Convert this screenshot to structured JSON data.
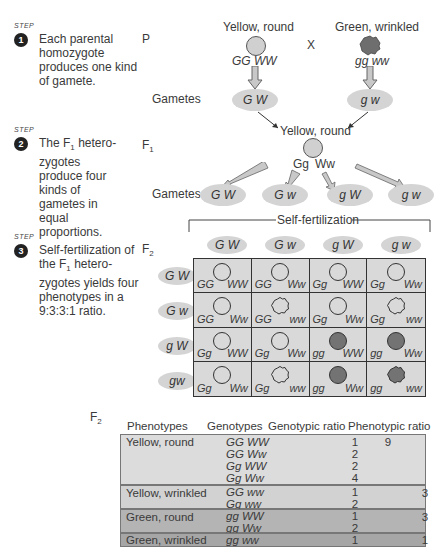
{
  "steps": [
    {
      "tag": "STEP",
      "number": "1",
      "text": "Each parental homozygote produces one kind of gamete."
    },
    {
      "tag": "STEP",
      "number": "2",
      "text": "The F₁ hetero-zygotes produce four kinds of gametes in equal proportions."
    },
    {
      "tag": "STEP",
      "number": "3",
      "text": "Self-fertilization of the F₁ hetero-zygotes yields four phenotypes in a 9:3:3:1 ratio."
    }
  ],
  "generation_labels": {
    "p": "P",
    "f1": "F",
    "f1_sub": "1",
    "f2": "F",
    "f2_sub": "2",
    "gametes": "Gametes",
    "cross": "X"
  },
  "parents": [
    {
      "phenotype": "Yellow, round",
      "genotype": "GG WW",
      "gamete": "G W",
      "color": "#d0d0d0",
      "shape": "round"
    },
    {
      "phenotype": "Green, wrinkled",
      "genotype": "gg ww",
      "gamete": "g w",
      "color": "#6e6e6e",
      "shape": "wrinkled"
    }
  ],
  "f1": {
    "phenotype": "Yellow, round",
    "genotype_g": "Gg",
    "genotype_w": "Ww",
    "gametes": [
      "G W",
      "G w",
      "g W",
      "g w"
    ]
  },
  "self_fertilization_label": "Self-fertilization",
  "punnett": {
    "column_gametes": [
      "G W",
      "G w",
      "g W",
      "g w"
    ],
    "row_gametes": [
      "G W",
      "G w",
      "g W",
      "gw"
    ],
    "cells": [
      [
        {
          "g": "GG",
          "w": "WW",
          "color": "yellow",
          "shape": "round"
        },
        {
          "g": "GG",
          "w": "Ww",
          "color": "yellow",
          "shape": "round"
        },
        {
          "g": "Gg",
          "w": "WW",
          "color": "yellow",
          "shape": "round"
        },
        {
          "g": "Gg",
          "w": "Ww",
          "color": "yellow",
          "shape": "round"
        }
      ],
      [
        {
          "g": "GG",
          "w": "Ww",
          "color": "yellow",
          "shape": "round"
        },
        {
          "g": "GG",
          "w": "ww",
          "color": "yellow",
          "shape": "wrinkled"
        },
        {
          "g": "Gg",
          "w": "Ww",
          "color": "yellow",
          "shape": "round"
        },
        {
          "g": "Gg",
          "w": "ww",
          "color": "yellow",
          "shape": "wrinkled"
        }
      ],
      [
        {
          "g": "Gg",
          "w": "WW",
          "color": "yellow",
          "shape": "round"
        },
        {
          "g": "Gg",
          "w": "Ww",
          "color": "yellow",
          "shape": "round"
        },
        {
          "g": "gg",
          "w": "WW",
          "color": "green",
          "shape": "round"
        },
        {
          "g": "gg",
          "w": "Ww",
          "color": "green",
          "shape": "round"
        }
      ],
      [
        {
          "g": "Gg",
          "w": "Ww",
          "color": "yellow",
          "shape": "round"
        },
        {
          "g": "Gg",
          "w": "ww",
          "color": "yellow",
          "shape": "wrinkled"
        },
        {
          "g": "gg",
          "w": "Ww",
          "color": "green",
          "shape": "round"
        },
        {
          "g": "gg",
          "w": "ww",
          "color": "green",
          "shape": "wrinkled"
        }
      ]
    ]
  },
  "f2_table": {
    "label": "F",
    "label_sub": "2",
    "headers": [
      "Phenotypes",
      "Genotypes",
      "Genotypic ratio",
      "Phenotypic ratio"
    ],
    "rows": [
      {
        "phenotype": "Yellow, round",
        "genotypes": [
          "GG  WW",
          "GG  Ww",
          "Gg  WW",
          "Gg  Ww"
        ],
        "genotypic_ratios": [
          "1",
          "2",
          "2",
          "4"
        ],
        "phenotypic_ratio": "9",
        "bg": "#dcdcdc"
      },
      {
        "phenotype": "Yellow, wrinkled",
        "genotypes": [
          "GG  ww",
          "Gg  ww"
        ],
        "genotypic_ratios": [
          "1",
          "2"
        ],
        "phenotypic_ratio": "3",
        "bg": "#d2d2d2"
      },
      {
        "phenotype": "Green, round",
        "genotypes": [
          "gg  WW",
          "gg  Ww"
        ],
        "genotypic_ratios": [
          "1",
          "2"
        ],
        "phenotypic_ratio": "3",
        "bg": "#b4b4b4"
      },
      {
        "phenotype": "Green, wrinkled",
        "genotypes": [
          "gg  ww"
        ],
        "genotypic_ratios": [
          "1"
        ],
        "phenotypic_ratio": "1",
        "bg": "#a6a6a6"
      }
    ]
  },
  "colors": {
    "yellow_pea": "#d0d0d0",
    "green_pea": "#737373",
    "oval": "#d4d4d4",
    "grid_bg": "#d9d9d9"
  }
}
